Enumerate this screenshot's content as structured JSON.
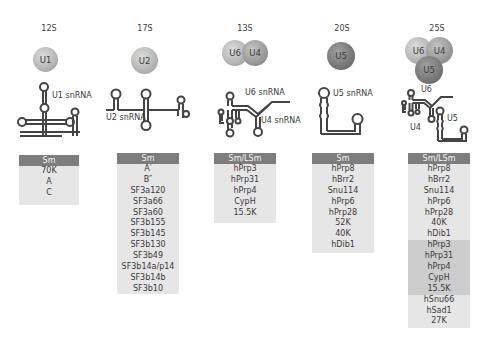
{
  "complexes": [
    {
      "sedimentation": "12S",
      "particles": [
        "U1"
      ],
      "snrna_labels": [
        "U1 snRNA"
      ],
      "table": {
        "header": "Sm",
        "proteins": [
          "70K",
          "A",
          "C"
        ]
      }
    },
    {
      "sedimentation": "17S",
      "particles": [
        "U2"
      ],
      "snrna_labels": [
        "U2 snRNA"
      ],
      "table": {
        "header": "Sm",
        "proteins": [
          "A′",
          "B″",
          "SF3a120",
          "SF3a66",
          "SF3a60",
          "SF3b155",
          "SF3b145",
          "SF3b130",
          "SF3b49",
          "SF3b14a/p14",
          "SF3b14b",
          "SF3b10"
        ]
      }
    },
    {
      "sedimentation": "13S",
      "particles": [
        "U6",
        "U4"
      ],
      "snrna_labels": [
        "U6 snRNA",
        "U4 snRNA"
      ],
      "table": {
        "header": "Sm/LSm",
        "proteins": [
          "hPrp3",
          "hPrp31",
          "hPrp4",
          "CypH",
          "15.5K"
        ]
      }
    },
    {
      "sedimentation": "20S",
      "particles": [
        "U5"
      ],
      "snrna_labels": [
        "U5 snRNA"
      ],
      "table": {
        "header": "Sm",
        "proteins": [
          "hPrp8",
          "hBrr2",
          "Snu114",
          "hPrp6",
          "hPrp28",
          "52K",
          "40K",
          "hDib1"
        ]
      }
    },
    {
      "sedimentation": "25S",
      "particles": [
        "U6",
        "U4",
        "U5"
      ],
      "snrna_labels": [
        "U6",
        "U4",
        "U5"
      ],
      "table": {
        "header": "Sm/LSm",
        "proteins": [
          "hPrp8",
          "hBrr2",
          "Snu114",
          "hPrp6",
          "hPrp28",
          "40K",
          "hDib1",
          "hPrp3",
          "hPrp31",
          "hPrp4",
          "CypH",
          "15.5K",
          "hSnu66",
          "hSad1",
          "27K"
        ],
        "shaded_rows": [
          7,
          8,
          9,
          10,
          11
        ]
      }
    }
  ],
  "colors": {
    "header_bg": "#7d7d7d",
    "box_bg": "#e6e6e6",
    "shaded_bg": "#cdcdcd",
    "line": "#444444"
  }
}
